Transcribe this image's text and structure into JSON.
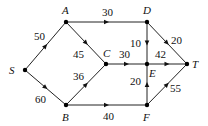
{
  "diagram": {
    "type": "directed-flow-network",
    "nodes": [
      {
        "id": "S",
        "label": "S",
        "x": 25,
        "y": 70,
        "lx": 9,
        "ly": 74
      },
      {
        "id": "A",
        "label": "A",
        "x": 66,
        "y": 22,
        "lx": 62,
        "ly": 14
      },
      {
        "id": "B",
        "label": "B",
        "x": 66,
        "y": 105,
        "lx": 62,
        "ly": 121
      },
      {
        "id": "C",
        "label": "C",
        "x": 106,
        "y": 64,
        "lx": 103,
        "ly": 57
      },
      {
        "id": "D",
        "label": "D",
        "x": 147,
        "y": 22,
        "lx": 143,
        "ly": 14
      },
      {
        "id": "E",
        "label": "E",
        "x": 147,
        "y": 64,
        "lx": 149,
        "ly": 77
      },
      {
        "id": "F",
        "label": "F",
        "x": 147,
        "y": 105,
        "lx": 143,
        "ly": 121
      },
      {
        "id": "T",
        "label": "T",
        "x": 187,
        "y": 64,
        "lx": 192,
        "ly": 68
      }
    ],
    "edges": [
      {
        "from": "S",
        "to": "A",
        "capacity": "50",
        "lx": 34,
        "ly": 40
      },
      {
        "from": "S",
        "to": "B",
        "capacity": "60",
        "lx": 35,
        "ly": 103
      },
      {
        "from": "A",
        "to": "D",
        "capacity": "30",
        "lx": 102,
        "ly": 16
      },
      {
        "from": "A",
        "to": "C",
        "capacity": "45",
        "lx": 73,
        "ly": 58
      },
      {
        "from": "B",
        "to": "C",
        "capacity": "36",
        "lx": 73,
        "ly": 80
      },
      {
        "from": "B",
        "to": "F",
        "capacity": "40",
        "lx": 103,
        "ly": 120
      },
      {
        "from": "C",
        "to": "E",
        "capacity": "30",
        "lx": 119,
        "ly": 58
      },
      {
        "from": "D",
        "to": "E",
        "capacity": "10",
        "lx": 130,
        "ly": 47
      },
      {
        "from": "D",
        "to": "T",
        "capacity": "20",
        "lx": 171,
        "ly": 44
      },
      {
        "from": "E",
        "to": "T",
        "capacity": "42",
        "lx": 155,
        "ly": 58
      },
      {
        "from": "F",
        "to": "E",
        "capacity": "20",
        "lx": 130,
        "ly": 85
      },
      {
        "from": "F",
        "to": "T",
        "capacity": "55",
        "lx": 170,
        "ly": 92
      }
    ]
  }
}
